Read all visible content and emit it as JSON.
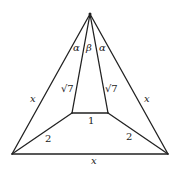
{
  "diagram": {
    "type": "geometry",
    "points": {
      "apex": [
        90,
        14
      ],
      "bottom_left": [
        12,
        154
      ],
      "bottom_right": [
        168,
        154
      ],
      "inner_left": [
        72,
        113
      ],
      "inner_right": [
        108,
        113
      ]
    },
    "labels": {
      "left_side": "x",
      "right_side": "x",
      "base": "x",
      "inner_left_segment": "√7",
      "inner_right_segment": "√7",
      "inner_base": "1",
      "lower_left_segment": "2",
      "lower_right_segment": "2",
      "angle_left": "α",
      "angle_middle": "β",
      "angle_right": "α"
    },
    "colors": {
      "stroke": "#222222",
      "background": "#ffffff"
    }
  }
}
